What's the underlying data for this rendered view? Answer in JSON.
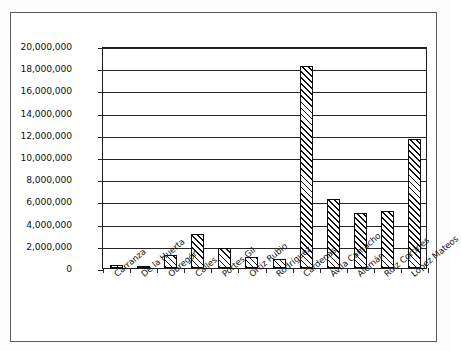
{
  "chart_data": {
    "type": "bar",
    "title": "",
    "xlabel": "",
    "ylabel": "",
    "ylim": [
      0,
      20000000
    ],
    "ytick_step": 2000000,
    "grid": true,
    "legend": "none",
    "axis_tick_labels": [
      "20,000,000",
      "18,000,000",
      "16,000,000",
      "14,000,000",
      "12,000,000",
      "10,000,000",
      "8,000,000",
      "6,000,000",
      "4,000,000",
      "2,000,000",
      "0"
    ],
    "categories": [
      "Carranza",
      "De la Huerta",
      "Obregón",
      "Calles",
      "Portes Gil",
      "Ortiz Rubio",
      "Rodríguez",
      "Cárdenas",
      "Ávila Camacho",
      "Alemán",
      "Ruiz Cortines",
      "López Mateos"
    ],
    "values": [
      250000,
      60000,
      1200000,
      3100000,
      1800000,
      950000,
      850000,
      18200000,
      6200000,
      5000000,
      5100000,
      11600000
    ],
    "bar_style": {
      "fill": "#ffffff",
      "edge": "#0d0d0d",
      "hatch": "diagonal-45"
    }
  },
  "figure": {
    "background": "#ffffff",
    "frame_color": "#5b5b5b",
    "axis_color": "#1c1c1c"
  }
}
